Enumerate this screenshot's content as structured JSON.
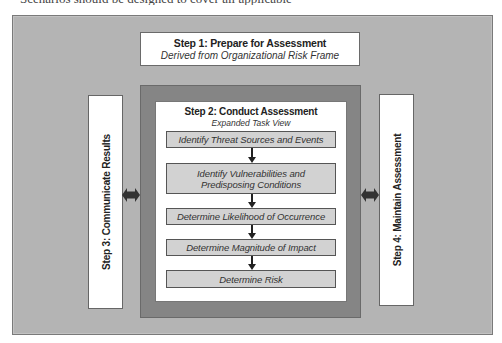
{
  "caption_cut": "Scenarios should be designed to cover all applicable",
  "diagram": {
    "step1": {
      "title": "Step 1: Prepare for Assessment",
      "subtitle": "Derived from Organizational Risk Frame"
    },
    "step2": {
      "title": "Step 2: Conduct Assessment",
      "subtitle": "Expanded Task View",
      "tasks": [
        {
          "label_line1": "Identify Threat Sources and Events",
          "label_line2": ""
        },
        {
          "label_line1": "Identify Vulnerabilities and",
          "label_line2": "Predisposing Conditions"
        },
        {
          "label_line1": "Determine Likelihood of Occurrence",
          "label_line2": ""
        },
        {
          "label_line1": "Determine Magnitude of Impact",
          "label_line2": ""
        },
        {
          "label_line1": "Determine Risk",
          "label_line2": ""
        }
      ]
    },
    "step3": {
      "title": "Step 3: Communicate Results"
    },
    "step4": {
      "title": "Step 4: Maintain Assessment"
    },
    "connectors": {
      "left": "double-arrow-step3-step2",
      "right": "double-arrow-step2-step4",
      "task_flow": "down-arrows"
    },
    "colors": {
      "outer_bg": "#b4b4b4",
      "frame_dark": "#858585",
      "task_fill": "#d2d2d2",
      "box_fill": "#ffffff",
      "arrow": "#222222"
    }
  }
}
